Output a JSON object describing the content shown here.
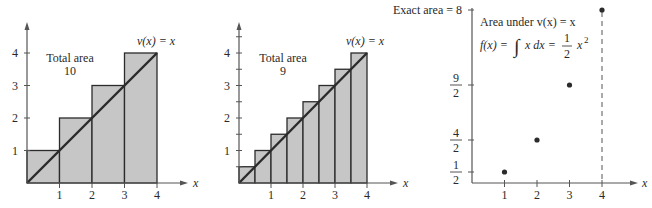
{
  "chart_data": [
    {
      "type": "bar",
      "title": "Left Riemann-style upper sum, width 1",
      "function_label": "v(x) = x",
      "annotation": [
        "Total area",
        "10"
      ],
      "xlabel": "x",
      "x_ticks": [
        "1",
        "2",
        "3",
        "4"
      ],
      "y_ticks": [
        "1",
        "2",
        "3",
        "4"
      ],
      "y_minor_ticks": false,
      "bar_width": 1,
      "bars": [
        {
          "x0": 0,
          "x1": 1,
          "height": 1
        },
        {
          "x0": 1,
          "x1": 2,
          "height": 2
        },
        {
          "x0": 2,
          "x1": 3,
          "height": 3
        },
        {
          "x0": 3,
          "x1": 4,
          "height": 4
        }
      ],
      "line": {
        "from": [
          0,
          0
        ],
        "to": [
          4,
          4
        ]
      },
      "xlim": [
        0,
        4.8
      ],
      "ylim": [
        0,
        5
      ]
    },
    {
      "type": "bar",
      "title": "Upper sum, width 1/2",
      "function_label": "v(x) = x",
      "annotation": [
        "Total area",
        "9"
      ],
      "xlabel": "x",
      "x_ticks": [
        "1",
        "2",
        "3",
        "4"
      ],
      "y_ticks": [
        "1",
        "2",
        "3",
        "4"
      ],
      "y_minor_ticks": true,
      "bar_width": 0.5,
      "bars": [
        {
          "x0": 0,
          "x1": 0.5,
          "height": 0.5
        },
        {
          "x0": 0.5,
          "x1": 1,
          "height": 1
        },
        {
          "x0": 1,
          "x1": 1.5,
          "height": 1.5
        },
        {
          "x0": 1.5,
          "x1": 2,
          "height": 2
        },
        {
          "x0": 2,
          "x1": 2.5,
          "height": 2.5
        },
        {
          "x0": 2.5,
          "x1": 3,
          "height": 3
        },
        {
          "x0": 3,
          "x1": 3.5,
          "height": 3.5
        },
        {
          "x0": 3.5,
          "x1": 4,
          "height": 4
        }
      ],
      "line": {
        "from": [
          0,
          0
        ],
        "to": [
          4,
          4
        ]
      },
      "xlim": [
        0,
        4.8
      ],
      "ylim": [
        0,
        5
      ]
    },
    {
      "type": "scatter",
      "title": "Area under v(x) = x",
      "formula": {
        "lhs": "f(x) =",
        "integral": "∫",
        "integrand": "x dx =",
        "frac_num": "1",
        "frac_den": "2",
        "rhs": "x",
        "exp": "2"
      },
      "exact_label": "Exact area = 8",
      "xlabel": "x",
      "x_ticks": [
        "1",
        "2",
        "3",
        "4"
      ],
      "y_ticks": [
        {
          "value": 0.5,
          "num": "1",
          "den": "2"
        },
        {
          "value": 2,
          "num": "4",
          "den": "2"
        },
        {
          "value": 4.5,
          "num": "9",
          "den": "2"
        },
        {
          "value": 8,
          "label": "Exact area = 8"
        }
      ],
      "points": [
        {
          "x": 1,
          "y": 0.5
        },
        {
          "x": 2,
          "y": 2
        },
        {
          "x": 3,
          "y": 4.5
        },
        {
          "x": 4,
          "y": 8
        }
      ],
      "dashed_vertical_at": 4
    }
  ],
  "colors": {
    "fill": "#c6c6c6",
    "stroke": "#2b2b2b",
    "axis": "#555555",
    "text": "#2a2a2a"
  }
}
